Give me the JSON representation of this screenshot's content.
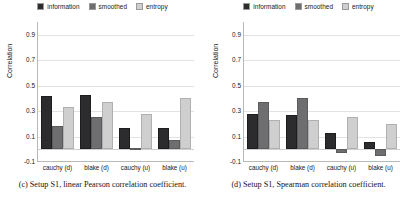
{
  "figure": {
    "panels": [
      {
        "id": "panel-c",
        "caption": "(c)  Setup S1, linear Pearson correlation coefficient.",
        "chart_data": {
          "type": "bar",
          "title": "",
          "xlabel": "",
          "ylabel": "Correlation",
          "categories": [
            "cauchy (d)",
            "blake (d)",
            "cauchy (u)",
            "blake (u)"
          ],
          "series": [
            {
              "name": "information",
              "color": "#2c2c2e",
              "values": [
                0.42,
                0.43,
                0.17,
                0.17
              ]
            },
            {
              "name": "smoothed",
              "color": "#6e6e70",
              "values": [
                0.18,
                0.25,
                0.01,
                0.07
              ]
            },
            {
              "name": "entropy",
              "color": "#cfcfcf",
              "values": [
                0.33,
                0.37,
                0.28,
                0.4
              ]
            }
          ],
          "ylim": [
            -0.1,
            1.0
          ],
          "yticks": [
            0.9,
            0.7,
            0.5,
            0.3,
            0.1,
            -0.1
          ],
          "ytick_labels": [
            "0.9",
            "0.7",
            "0.5",
            "0.3",
            "0.1",
            "-0.1"
          ],
          "grid": true,
          "legend_position": "top-center"
        }
      },
      {
        "id": "panel-d",
        "caption": "(d)  Setup S1, Spearman correlation coefficient.",
        "chart_data": {
          "type": "bar",
          "title": "",
          "xlabel": "",
          "ylabel": "Correlation",
          "categories": [
            "cauchy (d)",
            "blake (d)",
            "cauchy (u)",
            "blake (u)"
          ],
          "series": [
            {
              "name": "information",
              "color": "#2c2c2e",
              "values": [
                0.28,
                0.27,
                0.13,
                0.06
              ]
            },
            {
              "name": "smoothed",
              "color": "#6e6e70",
              "values": [
                0.37,
                0.4,
                -0.03,
                -0.05
              ]
            },
            {
              "name": "entropy",
              "color": "#cfcfcf",
              "values": [
                0.23,
                0.23,
                0.25,
                0.2
              ]
            }
          ],
          "ylim": [
            -0.1,
            1.0
          ],
          "yticks": [
            0.9,
            0.7,
            0.5,
            0.3,
            0.1,
            -0.1
          ],
          "ytick_labels": [
            "0.9",
            "0.7",
            "0.5",
            "0.3",
            "0.1",
            "-0.1"
          ],
          "grid": true,
          "legend_position": "top-center"
        }
      }
    ]
  }
}
